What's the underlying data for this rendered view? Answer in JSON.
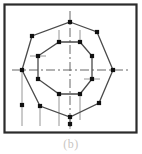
{
  "figure": {
    "caption": "(b)",
    "label": "cross-sectional-polygon-diagram",
    "frame": {
      "x": 4.5,
      "y": 4.5,
      "width": 132,
      "height": 128,
      "stroke": "#2b2b2b",
      "stroke_width": 2.2,
      "fill": "#ffffff"
    },
    "colors": {
      "outline": "#4a4a4a",
      "vertex": "#111111",
      "centerline": "#555555",
      "projection": "#8a8a8a",
      "frame": "#2b2b2b",
      "caption": "#c9c6c2",
      "background": "#ffffff"
    },
    "center": {
      "x": 70,
      "y": 70
    },
    "centerlines": {
      "style": "dash-dot",
      "dash_pattern": "9 3 2 3",
      "horizontal": {
        "x1": 12,
        "y1": 70,
        "x2": 128,
        "y2": 70
      },
      "vertical": {
        "x1": 70,
        "y1": 11,
        "x2": 70,
        "y2": 129
      }
    },
    "outer_polygon": {
      "name": "outer-octagon",
      "sides": 8,
      "stroke_width": 1.3,
      "vertices": [
        {
          "x": 70,
          "y": 22
        },
        {
          "x": 97,
          "y": 32
        },
        {
          "x": 113,
          "y": 70
        },
        {
          "x": 99,
          "y": 103
        },
        {
          "x": 70,
          "y": 117
        },
        {
          "x": 40,
          "y": 106
        },
        {
          "x": 22,
          "y": 70
        },
        {
          "x": 32,
          "y": 36
        }
      ]
    },
    "inner_polygon": {
      "name": "inner-octagon",
      "sides": 8,
      "stroke_width": 1.3,
      "vertices": [
        {
          "x": 59,
          "y": 42
        },
        {
          "x": 80,
          "y": 42
        },
        {
          "x": 92,
          "y": 56
        },
        {
          "x": 92,
          "y": 79
        },
        {
          "x": 80,
          "y": 94
        },
        {
          "x": 59,
          "y": 94
        },
        {
          "x": 38,
          "y": 79
        },
        {
          "x": 38,
          "y": 56
        }
      ]
    },
    "projection_lines": [
      {
        "name": "projection-left-vertex",
        "x1": 22,
        "y1": 70,
        "x2": 22,
        "y2": 126
      },
      {
        "name": "projection-lower-left-vertex",
        "x1": 40,
        "y1": 106,
        "x2": 40,
        "y2": 126
      },
      {
        "name": "projection-inner-bottom-left",
        "x1": 59,
        "y1": 94,
        "x2": 59,
        "y2": 126
      },
      {
        "name": "projection-bottom-vertex",
        "x1": 70,
        "y1": 117,
        "x2": 70,
        "y2": 129
      },
      {
        "name": "projection-inner-bottom-right",
        "x1": 80,
        "y1": 94,
        "x2": 80,
        "y2": 120
      },
      {
        "name": "projection-inner-top-left",
        "x1": 59,
        "y1": 42,
        "x2": 59,
        "y2": 30
      },
      {
        "name": "projection-inner-top-right",
        "x1": 80,
        "y1": 42,
        "x2": 80,
        "y2": 30
      },
      {
        "name": "projection-inner-left-upper",
        "x1": 30,
        "y1": 56,
        "x2": 46,
        "y2": 56
      },
      {
        "name": "projection-inner-right-lower",
        "x1": 84,
        "y1": 79,
        "x2": 100,
        "y2": 79
      }
    ],
    "projection_markers": [
      {
        "name": "marker-left-projection",
        "x": 22,
        "y": 105
      },
      {
        "name": "marker-bottom-projection",
        "x": 70,
        "y": 124
      }
    ],
    "vertex_marker": {
      "shape": "filled-square-dot",
      "radius": 2.1
    }
  }
}
